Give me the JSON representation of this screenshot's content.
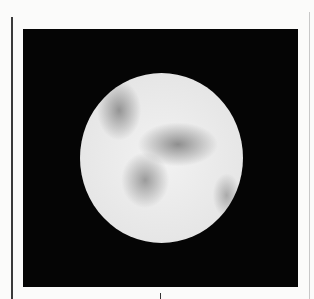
{
  "image": {
    "subject": "planet-drawing",
    "background_color": "#050505",
    "page_color": "#fbfbfa",
    "planet": {
      "shape": "disc",
      "base_color": "#ebebeb",
      "markings": [
        "upper-left-dark-patch",
        "central-dark-band",
        "lower-left-dark-patch",
        "right-edge-dark-patch"
      ]
    }
  }
}
